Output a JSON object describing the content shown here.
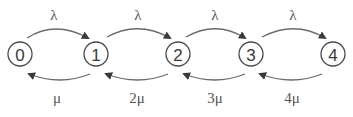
{
  "diagram": {
    "type": "birth-death-chain",
    "nodes": [
      {
        "id": "0",
        "label": "0",
        "x": 20,
        "y": 54
      },
      {
        "id": "1",
        "label": "1",
        "x": 96,
        "y": 54
      },
      {
        "id": "2",
        "label": "2",
        "x": 178,
        "y": 54
      },
      {
        "id": "3",
        "label": "3",
        "x": 251,
        "y": 54
      },
      {
        "id": "4",
        "label": "4",
        "x": 333,
        "y": 54
      }
    ],
    "forward_edges": [
      {
        "from": "0",
        "to": "1",
        "label": "λ",
        "label_x": 54,
        "label_y": 19
      },
      {
        "from": "1",
        "to": "2",
        "label": "λ",
        "label_x": 138,
        "label_y": 19
      },
      {
        "from": "2",
        "to": "3",
        "label": "λ",
        "label_x": 215,
        "label_y": 19
      },
      {
        "from": "3",
        "to": "4",
        "label": "λ",
        "label_x": 293,
        "label_y": 19
      }
    ],
    "backward_edges": [
      {
        "from": "1",
        "to": "0",
        "label": "μ",
        "label_x": 57,
        "label_y": 103
      },
      {
        "from": "2",
        "to": "1",
        "label": "2μ",
        "label_x": 137,
        "label_y": 103
      },
      {
        "from": "3",
        "to": "2",
        "label": "3μ",
        "label_x": 215,
        "label_y": 103
      },
      {
        "from": "4",
        "to": "3",
        "label": "4μ",
        "label_x": 292,
        "label_y": 103
      }
    ],
    "colors": {
      "stroke": "#4a4a4a",
      "arrow": "#6a6a6a",
      "text": "#3a3a3a"
    }
  }
}
